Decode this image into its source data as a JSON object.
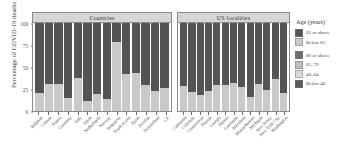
{
  "chart_data": {
    "type": "bar",
    "subtype": "stacked-percentage",
    "title": "",
    "xlabel": "",
    "ylabel": "Percentage of COVID-19 deaths",
    "ylim": [
      0,
      100
    ],
    "yticks": [
      0,
      25,
      50,
      75,
      100
    ],
    "ytick_labels": [
      "0",
      "25",
      "50",
      "75",
      "100"
    ],
    "grid": false,
    "legend_position": "right",
    "panels": [
      {
        "id": "countries",
        "title": "Countries",
        "categories": [
          "Belgium",
          "Canada",
          "France",
          "Germany",
          "Italy",
          "Japan",
          "Netherlands",
          "Norway",
          "Singapore",
          "South Korea",
          "Spain",
          "Sweden",
          "Switzerland",
          "UK"
        ],
        "series": [
          {
            "name": "Below 65",
            "color": "#c9c9c9",
            "values": [
              21,
              31,
              31,
              15,
              38,
              11,
              19,
              14,
              78,
              42,
              43,
              29,
              23,
              26
            ]
          },
          {
            "name": "65 or above",
            "color": "#545454",
            "values": [
              79,
              69,
              69,
              85,
              62,
              89,
              81,
              86,
              22,
              58,
              57,
              71,
              77,
              74
            ]
          }
        ]
      },
      {
        "id": "us-localities",
        "title": "US localities",
        "categories": [
          "California",
          "Colorado",
          "Connecticut",
          "Florida",
          "Georgia",
          "Illinois",
          "Louisiana",
          "Maryland",
          "Massachusetts",
          "Michigan",
          "New Jersey",
          "New York City",
          "Washington"
        ],
        "series": [
          {
            "name": "Below 65",
            "color": "#c9c9c9",
            "values": [
              28,
              22,
              18,
              23,
              30,
              29,
              32,
              27,
              16,
              31,
              24,
              36,
              20
            ]
          },
          {
            "name": "65 or above",
            "color": "#545454",
            "values": [
              72,
              78,
              82,
              77,
              70,
              71,
              68,
              73,
              84,
              69,
              76,
              64,
              80
            ]
          }
        ]
      }
    ]
  },
  "axes": {
    "ylabel": "Percentage of COVID-19 deaths",
    "ytick_labels": [
      "100",
      "75",
      "50",
      "25",
      "0"
    ]
  },
  "panels": {
    "countries_title": "Countries",
    "localities_title": "US localities"
  },
  "legend": {
    "title": "Age (years)",
    "groups": [
      {
        "items": [
          {
            "label": "65 or above",
            "color": "#545454"
          },
          {
            "label": "Below 65",
            "color": "#c9c9c9"
          }
        ]
      },
      {
        "items": [
          {
            "label": "80 or above",
            "color": "#6e6e6e"
          },
          {
            "label": "65–79",
            "color": "#bdbdbd"
          },
          {
            "label": "40–64",
            "color": "#d9d9d9"
          },
          {
            "label": "Below 40",
            "color": "#5a5a5a"
          }
        ]
      }
    ]
  }
}
